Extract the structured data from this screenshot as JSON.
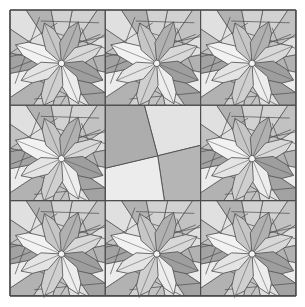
{
  "figure": {
    "canvas": {
      "width": 305,
      "height": 307,
      "background": "#ffffff"
    }
  },
  "grid": {
    "rows": 3,
    "cols": 3,
    "origin_x": 10,
    "origin_y": 10,
    "tile_size": 95.3,
    "line_color": "#4d4d4d",
    "line_width": 1.1,
    "outer_border_width": 1.6,
    "tiles": [
      {
        "row": 0,
        "col": 0,
        "type": "star"
      },
      {
        "row": 0,
        "col": 1,
        "type": "star"
      },
      {
        "row": 0,
        "col": 2,
        "type": "star"
      },
      {
        "row": 1,
        "col": 0,
        "type": "star"
      },
      {
        "row": 1,
        "col": 1,
        "type": "pinwheel"
      },
      {
        "row": 1,
        "col": 2,
        "type": "star"
      },
      {
        "row": 2,
        "col": 0,
        "type": "star"
      },
      {
        "row": 2,
        "col": 1,
        "type": "star"
      },
      {
        "row": 2,
        "col": 2,
        "type": "star"
      }
    ]
  },
  "palette": {
    "white": "#f4f4f4",
    "lightest": "#ececec",
    "light": "#e0e0e0",
    "mid_light": "#d2d2d2",
    "mid": "#c2c2c2",
    "mid_dark": "#b2b2b2",
    "dark": "#a3a3a3",
    "darkest": "#949494",
    "stroke": "#4d4d4d",
    "background": "#ffffff"
  },
  "star_block": {
    "name": "eight-pointed star flower block",
    "center_x": 0.54,
    "center_y": 0.56,
    "hub_radius": 0.035,
    "hub_fill": "#f4f4f4",
    "petal_count": 8,
    "petals": [
      {
        "angle_deg": 270,
        "length": 0.52,
        "half_width": 0.105,
        "fill": "#f2f2f2"
      },
      {
        "angle_deg": 315,
        "length": 0.46,
        "half_width": 0.095,
        "fill": "#c6c6c6"
      },
      {
        "angle_deg": 0,
        "length": 0.47,
        "half_width": 0.1,
        "fill": "#b0b0b0"
      },
      {
        "angle_deg": 45,
        "length": 0.46,
        "half_width": 0.095,
        "fill": "#d8d8d8"
      },
      {
        "angle_deg": 90,
        "length": 0.47,
        "half_width": 0.105,
        "fill": "#9e9e9e"
      },
      {
        "angle_deg": 135,
        "length": 0.46,
        "half_width": 0.095,
        "fill": "#ededed"
      },
      {
        "angle_deg": 180,
        "length": 0.5,
        "half_width": 0.1,
        "fill": "#cfcfcf"
      },
      {
        "angle_deg": 225,
        "length": 0.46,
        "half_width": 0.095,
        "fill": "#e4e4e4"
      }
    ],
    "background_wedges": [
      {
        "fill": "#d0d0d0"
      },
      {
        "fill": "#bdbdbd"
      },
      {
        "fill": "#e2e2e2"
      },
      {
        "fill": "#cacaca"
      },
      {
        "fill": "#b6b6b6"
      },
      {
        "fill": "#dcdcdc"
      },
      {
        "fill": "#c4c4c4"
      },
      {
        "fill": "#e8e8e8"
      }
    ]
  },
  "pinwheel_block": {
    "name": "four-triangle pinwheel block",
    "pivot_x": 0.55,
    "pivot_y": 0.53,
    "triangles": [
      {
        "name": "top-triangle",
        "fill": "#e3e3e3"
      },
      {
        "name": "right-triangle",
        "fill": "#b5b5b5"
      },
      {
        "name": "bottom-triangle",
        "fill": "#ececec"
      },
      {
        "name": "left-triangle",
        "fill": "#adadad"
      }
    ]
  }
}
